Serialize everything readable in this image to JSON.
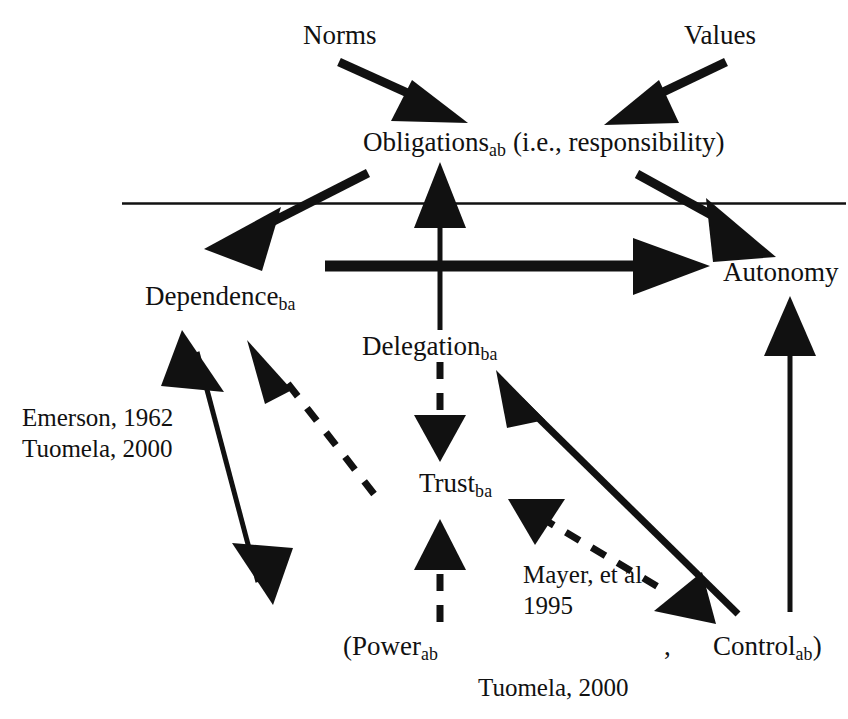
{
  "diagram": {
    "background_color": "#ffffff",
    "stroke_color": "#111111",
    "nodes": {
      "norms": {
        "text": "Norms"
      },
      "values": {
        "text": "Values"
      },
      "obligations": {
        "base": "Obligations",
        "subscript": "ab",
        "suffix": " (i.e., responsibility)"
      },
      "dependence": {
        "base": "Dependence",
        "subscript": "ba"
      },
      "autonomy": {
        "text": "Autonomy"
      },
      "delegation": {
        "base": "Delegation",
        "subscript": "ba"
      },
      "trust": {
        "base": "Trust",
        "subscript": "ba"
      },
      "power": {
        "base": "(Power",
        "subscript": "ab"
      },
      "comma": {
        "text": ","
      },
      "control": {
        "base": "Control",
        "subscript": "ab",
        "suffix": ")"
      }
    },
    "citations": {
      "emerson_tuomela": {
        "line1": "Emerson, 1962",
        "line2": "Tuomela, 2000"
      },
      "mayer": {
        "line1": "Mayer, et al",
        "line2": "1995"
      },
      "tuomela_bottom": {
        "line1": "Tuomela, 2000"
      }
    },
    "edges": [
      {
        "name": "norms-to-obligations",
        "style": "solid",
        "heads": "single"
      },
      {
        "name": "values-to-obligations",
        "style": "solid",
        "heads": "single"
      },
      {
        "name": "delegation-to-obligations",
        "style": "solid",
        "heads": "single"
      },
      {
        "name": "obligations-to-dependence",
        "style": "solid",
        "heads": "single"
      },
      {
        "name": "obligations-to-autonomy",
        "style": "solid",
        "heads": "single"
      },
      {
        "name": "dependence-to-autonomy",
        "style": "solid",
        "heads": "single"
      },
      {
        "name": "delegation-to-trust",
        "style": "dashed",
        "heads": "single"
      },
      {
        "name": "power-to-trust",
        "style": "dashed",
        "heads": "single"
      },
      {
        "name": "dependence-power-double",
        "style": "solid",
        "heads": "double"
      },
      {
        "name": "power-to-dependence-dashed",
        "style": "dashed",
        "heads": "single"
      },
      {
        "name": "control-to-delegation",
        "style": "solid",
        "heads": "single"
      },
      {
        "name": "trust-to-control",
        "style": "dashed",
        "heads": "single"
      },
      {
        "name": "control-to-autonomy",
        "style": "solid",
        "heads": "single"
      },
      {
        "name": "horizontal-separator",
        "style": "solid",
        "heads": "none"
      }
    ]
  }
}
